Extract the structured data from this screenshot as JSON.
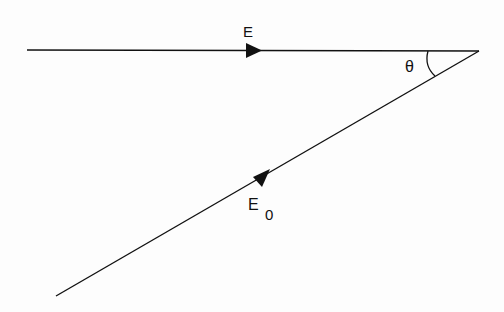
{
  "diagram": {
    "type": "vector-angle",
    "colors": {
      "line": "#111111",
      "background": "#fdfdfd"
    },
    "vectors": [
      {
        "id": "E",
        "label": "E",
        "subscript": "",
        "from": [
          27,
          50
        ],
        "to": [
          479,
          51
        ],
        "arrow_at": [
          255,
          50
        ]
      },
      {
        "id": "E0",
        "label": "E",
        "subscript": "0",
        "from": [
          56,
          296
        ],
        "to": [
          479,
          51
        ],
        "arrow_at": [
          264,
          179
        ]
      }
    ],
    "angle": {
      "label": "θ",
      "vertex": [
        479,
        51
      ],
      "between": [
        "E",
        "E0"
      ]
    }
  }
}
